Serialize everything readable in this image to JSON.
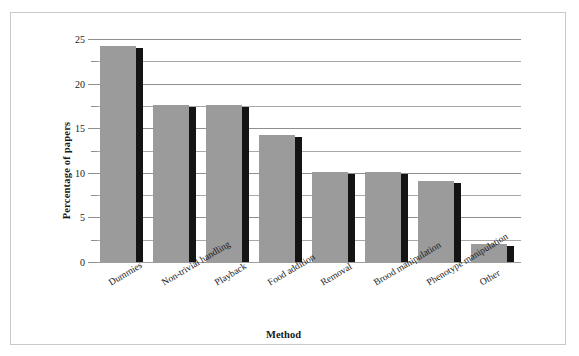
{
  "chart_data": {
    "type": "bar",
    "title": "",
    "xlabel": "Method",
    "ylabel": "Percentage of papers",
    "categories": [
      "Dummies",
      "Non-trivial handling",
      "Playback",
      "Food addition",
      "Removal",
      "Brood manipulation",
      "Phenotype manipulation",
      "Other"
    ],
    "values": [
      24.2,
      17.6,
      17.6,
      14.2,
      10.1,
      10.1,
      9.1,
      2.0
    ],
    "ylim": [
      0,
      25
    ],
    "ytick_labels": [
      "0",
      "5",
      "10",
      "15",
      "20",
      "25"
    ],
    "ytick_values": [
      0,
      5,
      10,
      15,
      20,
      25
    ],
    "minor_gridline_values": [
      2.5,
      7.5,
      12.5,
      17.5,
      22.5
    ],
    "grid": true,
    "legend": "none",
    "bar_color": "#9b9b9b",
    "bar_shadow_color": "#141414",
    "gridline_color": "#8f8f8f",
    "frame_color": "#c9c9c9"
  }
}
